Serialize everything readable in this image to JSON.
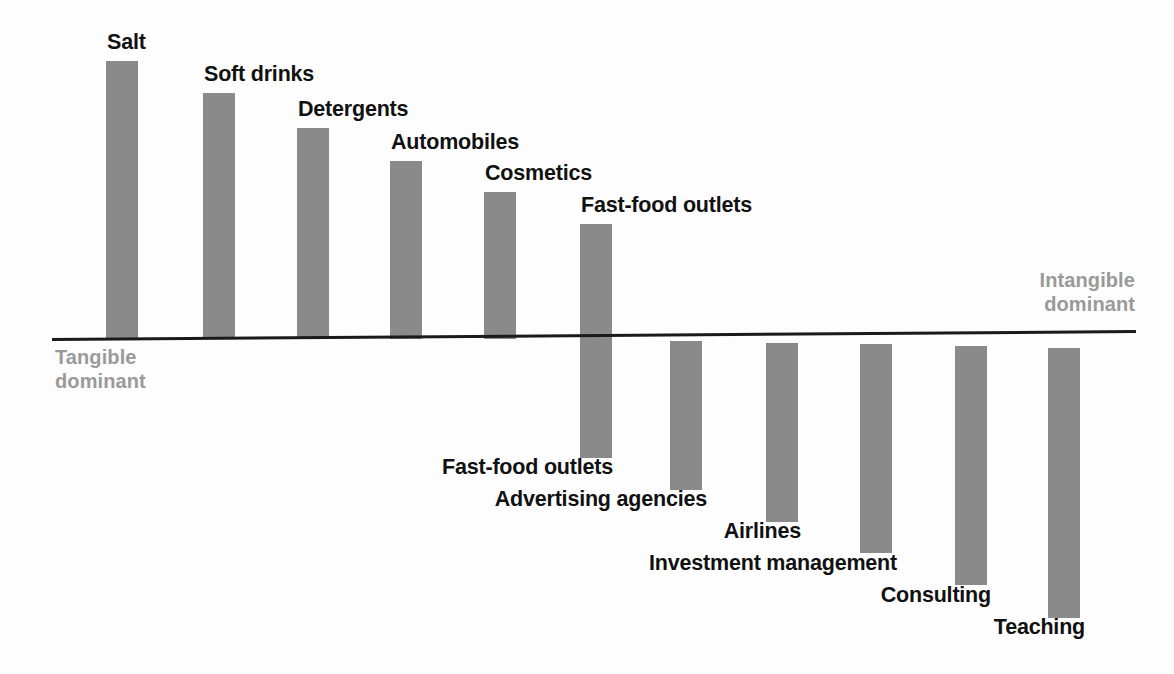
{
  "chart_data": {
    "type": "bar",
    "title": "",
    "subtitle": "",
    "xlabel": "",
    "ylabel": "",
    "grid": false,
    "legend": "none",
    "orientation": "vertical-diverging",
    "baseline_label_left": "Tangible dominant",
    "baseline_label_right": "Intangible dominant",
    "axis_note": "Bars above the line indicate tangible-dominant offerings; bars below indicate intangible-dominant offerings. Magnitudes are relative (no numeric scale printed).",
    "ylim": [
      -100,
      100
    ],
    "categories": [
      "Salt",
      "Soft drinks",
      "Detergents",
      "Automobiles",
      "Cosmetics",
      "Fast-food outlets",
      "Advertising agencies",
      "Airlines",
      "Investment management",
      "Consulting",
      "Teaching"
    ],
    "values": [
      88,
      78,
      67,
      56,
      46,
      36,
      -48,
      -59,
      -69,
      -79,
      -90
    ],
    "bars": [
      {
        "label": "Salt",
        "value": 88,
        "direction": "up",
        "x": 106,
        "top": 61,
        "height": 278,
        "label_x": 107,
        "label_y": 31,
        "label_align": "left"
      },
      {
        "label": "Soft drinks",
        "value": 78,
        "direction": "up",
        "x": 203,
        "top": 93,
        "height": 246,
        "label_x": 204,
        "label_y": 63,
        "label_align": "left"
      },
      {
        "label": "Detergents",
        "value": 67,
        "direction": "up",
        "x": 297,
        "top": 128,
        "height": 211,
        "label_x": 298,
        "label_y": 98,
        "label_align": "left"
      },
      {
        "label": "Automobiles",
        "value": 56,
        "direction": "up",
        "x": 390,
        "top": 161,
        "height": 178,
        "label_x": 391,
        "label_y": 131,
        "label_align": "left"
      },
      {
        "label": "Cosmetics",
        "value": 46,
        "direction": "up",
        "x": 484,
        "top": 192,
        "height": 147,
        "label_x": 485,
        "label_y": 162,
        "label_align": "left"
      },
      {
        "label": "Fast-food outlets",
        "value": 36,
        "direction": "up",
        "x": 580,
        "top": 224,
        "height": 115,
        "label_x": 581,
        "label_y": 194,
        "label_align": "left"
      },
      {
        "label": "Fast-food outlets",
        "value": -36,
        "direction": "down",
        "x": 580,
        "top": 339,
        "height": 119,
        "label_x": 613,
        "label_y": 456,
        "label_align": "right"
      },
      {
        "label": "Advertising agencies",
        "value": -48,
        "direction": "down",
        "x": 670,
        "top": 341,
        "height": 149,
        "label_x": 707,
        "label_y": 488,
        "label_align": "right"
      },
      {
        "label": "Airlines",
        "value": -59,
        "direction": "down",
        "x": 766,
        "top": 343,
        "height": 179,
        "label_x": 801,
        "label_y": 520,
        "label_align": "right"
      },
      {
        "label": "Investment management",
        "value": -69,
        "direction": "down",
        "x": 860,
        "top": 344,
        "height": 209,
        "label_x": 897,
        "label_y": 552,
        "label_align": "right"
      },
      {
        "label": "Consulting",
        "value": -79,
        "direction": "down",
        "x": 955,
        "top": 346,
        "height": 239,
        "label_x": 991,
        "label_y": 584,
        "label_align": "right"
      },
      {
        "label": "Teaching",
        "value": -90,
        "direction": "down",
        "x": 1048,
        "top": 348,
        "height": 270,
        "label_x": 1085,
        "label_y": 616,
        "label_align": "right"
      }
    ],
    "colors": {
      "bar": "#8a8a8a",
      "axis": "#1a1a1a",
      "label_text": "#111111",
      "pole_text": "#9a9a9a",
      "background": "#fdfdfd"
    }
  },
  "poles": {
    "tangible_line1": "Tangible",
    "tangible_line2": "dominant",
    "intangible_line1": "Intangible",
    "intangible_line2": "dominant"
  }
}
